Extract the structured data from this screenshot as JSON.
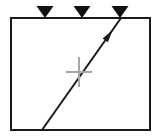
{
  "figure": {
    "background_color": "#ffffff",
    "width": 159,
    "height": 139
  },
  "frame": {
    "name": "outer-rectangle",
    "x": 11,
    "y": 18,
    "width": 139,
    "height": 112,
    "stroke_color": "#1a1a1a",
    "stroke_width": 2,
    "fill": "none"
  },
  "markers": {
    "shape": "down-triangle",
    "fill_color": "#111111",
    "count": 3,
    "items": [
      {
        "label": "marker-1",
        "x": 45,
        "y": 18,
        "width": 17,
        "height": 12
      },
      {
        "label": "marker-2",
        "x": 82,
        "y": 18,
        "width": 17,
        "height": 12
      },
      {
        "label": "marker-3",
        "x": 120,
        "y": 18,
        "width": 17,
        "height": 12
      }
    ]
  },
  "arrow": {
    "name": "diagonal-arrow",
    "x1": 42,
    "y1": 130,
    "x2": 121,
    "y2": 18,
    "stroke_color": "#1a1a1a",
    "stroke_width": 2,
    "arrowhead": {
      "x": 109,
      "y": 35,
      "length": 13,
      "half_width": 3.2
    }
  },
  "crosshair": {
    "name": "center-crosshair",
    "center_x": 79,
    "center_y": 72,
    "half_width": 13,
    "half_height": 15,
    "stroke_color": "#a6a6a6",
    "stroke_width": 2
  }
}
